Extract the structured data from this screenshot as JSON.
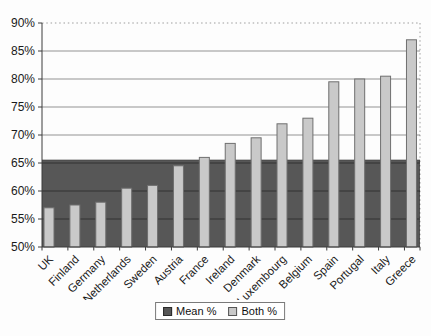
{
  "page": {
    "background": "#fdfdfd"
  },
  "chart_data": {
    "type": "bar",
    "title": "",
    "xlabel": "",
    "ylabel": "",
    "categories": [
      "UK",
      "Finland",
      "Germany",
      "Netherlands",
      "Sweden",
      "Austria",
      "France",
      "Ireland",
      "Denmark",
      "Luxembourg",
      "Belgium",
      "Spain",
      "Portugal",
      "Italy",
      "Greece"
    ],
    "series": [
      {
        "name": "Mean %",
        "render": "band",
        "values": [
          65.5,
          65.5,
          65.5,
          65.5,
          65.5,
          65.5,
          65.5,
          65.5,
          65.5,
          65.5,
          65.5,
          65.5,
          65.5,
          65.5,
          65.5
        ],
        "color": "#575757",
        "edge_color": "#3e3e3e"
      },
      {
        "name": "Both %",
        "render": "bars",
        "values": [
          57,
          57.5,
          58,
          60.5,
          61,
          64.5,
          66,
          68.5,
          69.5,
          72,
          73,
          79.5,
          80,
          80.5,
          87
        ],
        "color": "#c9c9c9",
        "border_color": "#6f6f6f"
      }
    ],
    "ylim": [
      50,
      90
    ],
    "ytick_step": 5,
    "ytick_labels": [
      "50%",
      "55%",
      "60%",
      "65%",
      "70%",
      "75%",
      "80%",
      "85%",
      "90%"
    ],
    "grid": true,
    "gridline_color": "rgba(0,0,0,0.42)",
    "frame": {
      "top": "dotted",
      "right": "dotted"
    },
    "axis_color": "#3c3c3c",
    "tick_label_color": "#1a1a1a",
    "legend": {
      "position": "bottom-center"
    }
  }
}
